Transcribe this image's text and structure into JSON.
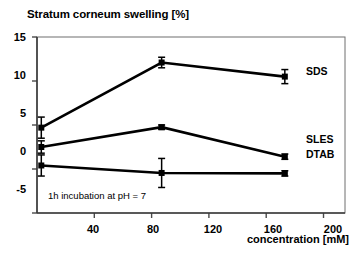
{
  "chart_data": {
    "type": "line",
    "title": "Stratum corneum swelling [%]",
    "xlabel": "concentration [mM]",
    "ylabel": "",
    "annotation": "1h incubation at pH = 7",
    "xlim": [
      0,
      215
    ],
    "ylim": [
      -5,
      15
    ],
    "xticks": [
      40,
      80,
      120,
      160,
      200
    ],
    "yticks": [
      -5,
      0,
      5,
      10,
      15
    ],
    "xticklabels": [
      "40",
      "80",
      "120",
      "160",
      "200"
    ],
    "yticklabels": [
      "-5",
      "0",
      "5",
      "10",
      "15"
    ],
    "grid": false,
    "legend_position": "right-inline",
    "marker": "square",
    "errorbars": true,
    "series": [
      {
        "name": "SDS",
        "x": [
          3,
          87,
          173
        ],
        "values": [
          4.7,
          12.1,
          10.5
        ],
        "errors": [
          1.2,
          0.6,
          0.8
        ],
        "color": "#000000"
      },
      {
        "name": "SLES",
        "x": [
          3,
          87,
          173
        ],
        "values": [
          2.5,
          4.75,
          1.4
        ],
        "errors": [
          0.7,
          0.25,
          0.3
        ],
        "color": "#000000"
      },
      {
        "name": "DTAB",
        "x": [
          3,
          87,
          173
        ],
        "values": [
          0.4,
          -0.45,
          -0.5
        ],
        "errors": [
          1.2,
          1.65,
          0.3
        ],
        "color": "#000000"
      }
    ]
  },
  "labels": {
    "y_15": "15",
    "y_10": "10",
    "y_5": "5",
    "y_0": "0",
    "y_m5": "-5",
    "x_40": "40",
    "x_80": "80",
    "x_120": "120",
    "x_160": "160",
    "x_200": "200",
    "series_sds": "SDS",
    "series_sles": "SLES",
    "series_dtab": "DTAB"
  }
}
